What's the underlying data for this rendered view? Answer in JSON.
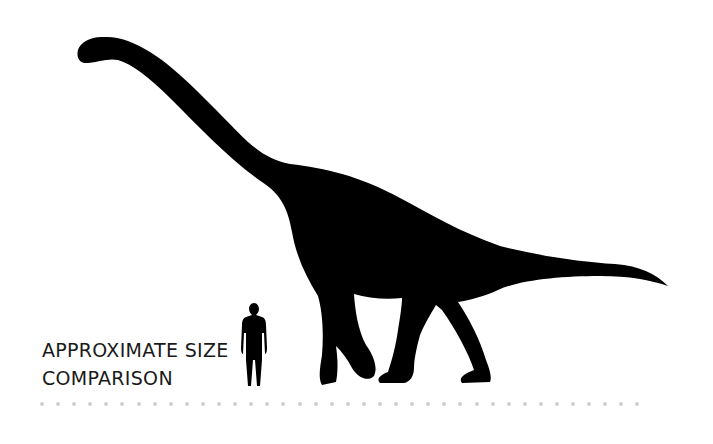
{
  "caption": {
    "line1": "APPROXIMATE SIZE",
    "line2": "COMPARISON"
  },
  "figures": {
    "dinosaur": "sauropod-silhouette",
    "human": "human-silhouette"
  },
  "colors": {
    "silhouette": "#000000",
    "text": "#1a1a1a",
    "ground_dots": "#cfcfcf",
    "background": "#ffffff"
  },
  "ground": {
    "dot_count": 38
  }
}
